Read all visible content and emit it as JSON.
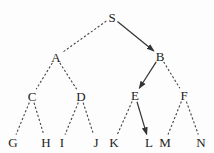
{
  "diagram": {
    "type": "tree",
    "nodes": [
      {
        "id": "S",
        "label": "S"
      },
      {
        "id": "A",
        "label": "A"
      },
      {
        "id": "B",
        "label": "B"
      },
      {
        "id": "C",
        "label": "C"
      },
      {
        "id": "D",
        "label": "D"
      },
      {
        "id": "E",
        "label": "E"
      },
      {
        "id": "F",
        "label": "F"
      },
      {
        "id": "G",
        "label": "G"
      },
      {
        "id": "H",
        "label": "H"
      },
      {
        "id": "I",
        "label": "I"
      },
      {
        "id": "J",
        "label": "J"
      },
      {
        "id": "K",
        "label": "K"
      },
      {
        "id": "L",
        "label": "L"
      },
      {
        "id": "M",
        "label": "M"
      },
      {
        "id": "N",
        "label": "N"
      }
    ],
    "edges": [
      {
        "from": "S",
        "to": "A",
        "style": "dashed"
      },
      {
        "from": "S",
        "to": "B",
        "style": "solid-arrow"
      },
      {
        "from": "A",
        "to": "C",
        "style": "dashed"
      },
      {
        "from": "A",
        "to": "D",
        "style": "dashed"
      },
      {
        "from": "B",
        "to": "E",
        "style": "solid-arrow"
      },
      {
        "from": "B",
        "to": "F",
        "style": "dashed"
      },
      {
        "from": "C",
        "to": "G",
        "style": "dashed"
      },
      {
        "from": "C",
        "to": "H",
        "style": "dashed"
      },
      {
        "from": "D",
        "to": "I",
        "style": "dashed"
      },
      {
        "from": "D",
        "to": "J",
        "style": "dashed"
      },
      {
        "from": "E",
        "to": "K",
        "style": "dashed"
      },
      {
        "from": "E",
        "to": "L",
        "style": "solid-arrow"
      },
      {
        "from": "F",
        "to": "M",
        "style": "dashed"
      },
      {
        "from": "F",
        "to": "N",
        "style": "dashed"
      }
    ],
    "highlighted_path": [
      "S",
      "B",
      "E",
      "L"
    ]
  }
}
